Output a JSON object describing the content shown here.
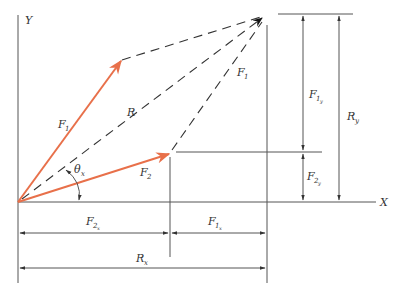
{
  "diagram": {
    "title": "",
    "axes": {
      "x_label": "X",
      "y_label": "Y"
    },
    "vectors": [
      {
        "name": "F1",
        "label": "F",
        "sub": "1",
        "color": "#e8704a"
      },
      {
        "name": "F2",
        "label": "F",
        "sub": "2",
        "color": "#e8704a"
      },
      {
        "name": "R",
        "label": "R",
        "style": "dashed"
      },
      {
        "name": "F1-translated",
        "label": "F",
        "sub": "1",
        "style": "dashed"
      }
    ],
    "angle": {
      "label": "θ",
      "sub": "x"
    },
    "dimensions": {
      "F1y": {
        "label": "F",
        "sub": "1",
        "subsub": "y"
      },
      "F2y": {
        "label": "F",
        "sub": "2",
        "subsub": "y"
      },
      "Ry": {
        "label": "R",
        "sub": "y"
      },
      "F2x": {
        "label": "F",
        "sub": "2",
        "subsub": "x"
      },
      "F1x": {
        "label": "F",
        "sub": "1",
        "subsub": "x"
      },
      "Rx": {
        "label": "R",
        "sub": "x"
      }
    },
    "colors": {
      "vector": "#e8704a",
      "line": "#555555",
      "dashed": "#333333"
    }
  }
}
